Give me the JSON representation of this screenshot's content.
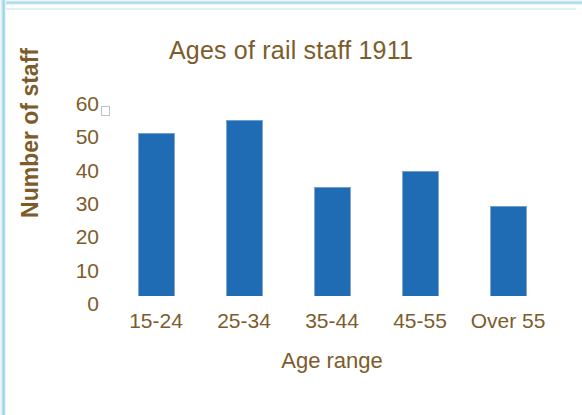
{
  "chart_data": {
    "type": "bar",
    "title": "Ages of rail staff 1911",
    "xlabel": "Age range",
    "ylabel": "Number of staff",
    "categories": [
      "15-24",
      "25-34",
      "35-44",
      "45-55",
      "Over 55"
    ],
    "values": [
      51,
      55,
      34,
      39,
      28
    ],
    "ylim": [
      0,
      60
    ],
    "yticks": [
      "0",
      "10",
      "20",
      "30",
      "40",
      "50",
      "60"
    ],
    "ytick_values": [
      0,
      10,
      20,
      30,
      40,
      50,
      60
    ],
    "grid": false,
    "legend": "none",
    "bar_color": "#1f6cb4",
    "text_color": "#7d5c2c",
    "background_color": "#ffffff",
    "frame_color": "#9fd6e8",
    "marker": {
      "name": "legend-placeholder-square",
      "color": "#ffffff",
      "border_color": "#b9c4cf"
    }
  }
}
